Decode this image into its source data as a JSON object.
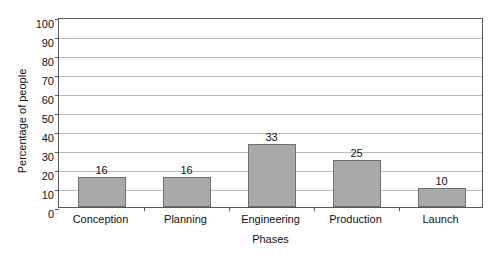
{
  "chart_data": {
    "type": "bar",
    "title": "",
    "categories": [
      "Conception",
      "Planning",
      "Engineering",
      "Production",
      "Launch"
    ],
    "values": [
      16,
      16,
      33,
      25,
      10
    ],
    "value_labels": [
      "16",
      "16",
      "33",
      "25",
      "10"
    ],
    "xlabel": "Phases",
    "ylabel": "Percentage of people",
    "ylim": [
      0,
      100
    ],
    "ytick_labels": [
      "100",
      "90",
      "80",
      "70",
      "60",
      "50",
      "40",
      "30",
      "20",
      "10",
      "0"
    ],
    "ytick_values": [
      100,
      90,
      80,
      70,
      60,
      50,
      40,
      30,
      20,
      10,
      0
    ],
    "grid": true,
    "legend": "none",
    "bar_color": "#a9a9a9",
    "bar_border_color": "#6d7073",
    "gridline_color": "#b9bcbf",
    "axis_color": "#55585c",
    "background_color": "#ffffff"
  }
}
